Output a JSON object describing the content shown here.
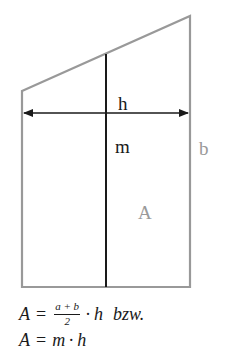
{
  "figure": {
    "shape": "trapezoid",
    "colors": {
      "outline": "#999999",
      "midline": "#1a1a1a",
      "arrow": "#1a1a1a",
      "label_dark": "#1a1a1a",
      "label_gray": "#999999"
    },
    "labels": {
      "height": "h",
      "midline": "m",
      "side_b": "b",
      "area": "A"
    }
  },
  "formulas": {
    "line1": {
      "lhs": "A",
      "eq": "=",
      "numerator": "a + b",
      "denominator": "2",
      "dot": "·",
      "var": "h",
      "suffix": "bzw."
    },
    "line2": {
      "lhs": "A",
      "eq": "=",
      "m": "m",
      "dot": "·",
      "h": "h"
    }
  }
}
